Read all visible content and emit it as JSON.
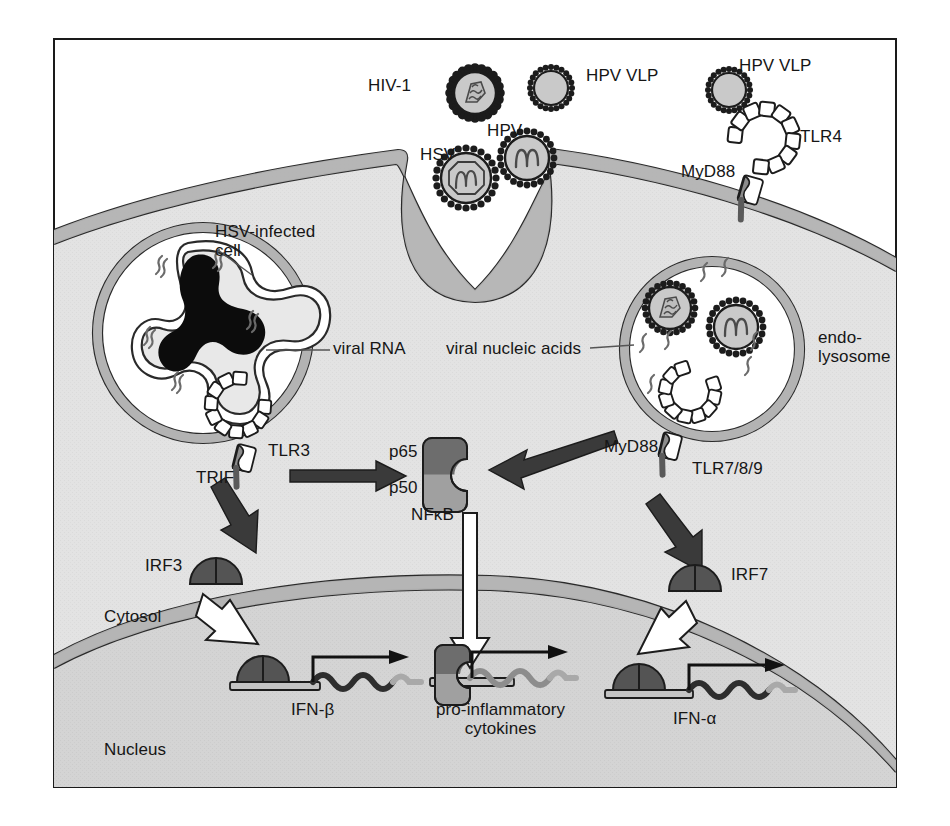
{
  "figure": {
    "frame": {
      "x": 53,
      "y": 38,
      "width": 844,
      "height": 750,
      "border_color": "#1a1a1a"
    },
    "palette": {
      "background": "#ffffff",
      "cytosol_fill": "#e3e3e3",
      "nucleus_fill": "#d4d4d4",
      "membrane_fill": "#b3b3b3",
      "membrane_stroke": "#2a2a2a",
      "capsid_stroke": "#1c1c1c",
      "virion_fill": "#c9c9c9",
      "dark_arrow": "#3a3a3a",
      "white_arrow_fill": "#ffffff",
      "irf_dark": "#545454",
      "nfkb_p65": "#6d6d6d",
      "nfkb_p50": "#a0a0a0",
      "tlr_fill": "#ffffff",
      "adaptor_fill": "#8c8c8c",
      "gene_dark": "#3a3a3a",
      "gene_light": "#a9a9a9",
      "text": "#161616"
    }
  },
  "labels": {
    "hiv1": "HIV-1",
    "hpv_vlp_center": "HPV VLP",
    "hpv_vlp_right": "HPV VLP",
    "hsv": "HSV",
    "hpv": "HPV",
    "tlr4": "TLR4",
    "myd88_top": "MyD88",
    "hsv_infected_cell": "HSV-infected\ncell",
    "viral_rna": "viral RNA",
    "viral_nucleic_acids": "viral nucleic acids",
    "endolysosome": "endo-\nlysosome",
    "tlr3": "TLR3",
    "trif": "TRIF",
    "myd88_right": "MyD88",
    "tlr789": "TLR7/8/9",
    "p65": "p65",
    "p50": "p50",
    "nfkb": "NFκB",
    "irf3": "IRF3",
    "irf7": "IRF7",
    "cytosol": "Cytosol",
    "nucleus": "Nucleus",
    "ifn_beta": "IFN-β",
    "pro_inflammatory_cytokines": "pro-inflammatory\ncytokines",
    "ifn_alpha": "IFN-α"
  },
  "entities": {
    "virions": [
      {
        "name": "HIV-1",
        "type": "enveloped-virion",
        "content": "rna-squiggle",
        "cx": 475,
        "cy": 93,
        "r": 25
      },
      {
        "name": "HPV VLP",
        "type": "empty-capsid",
        "content": "none",
        "cx": 551,
        "cy": 88,
        "r": 21
      },
      {
        "name": "HSV",
        "type": "enveloped-virion",
        "content": "dna-hexagon",
        "cx": 466,
        "cy": 178,
        "r": 30
      },
      {
        "name": "HPV",
        "type": "enveloped-virion",
        "content": "dna-squiggle",
        "cx": 527,
        "cy": 158,
        "r": 27
      },
      {
        "name": "HPV VLP",
        "type": "empty-capsid",
        "content": "none",
        "cx": 729,
        "cy": 90,
        "r": 21
      },
      {
        "name": "endolysosome virion 1",
        "type": "enveloped-virion",
        "content": "rna-squiggle",
        "cx": 670,
        "cy": 308,
        "r": 25
      },
      {
        "name": "endolysosome virion 2",
        "type": "enveloped-virion",
        "content": "dna-squiggle",
        "cx": 736,
        "cy": 327,
        "r": 27
      }
    ],
    "receptors": [
      {
        "name": "TLR4",
        "location": "plasma membrane",
        "adaptor": "MyD88"
      },
      {
        "name": "TLR3",
        "location": "HSV-infected cell endosome",
        "adaptor": "TRIF"
      },
      {
        "name": "TLR7/8/9",
        "location": "endolysosome",
        "adaptor": "MyD88"
      }
    ],
    "transcription_factors": [
      {
        "name": "IRF3",
        "activated_by": "TRIF",
        "target_gene": "IFN-β"
      },
      {
        "name": "NFκB",
        "subunits": [
          "p65",
          "p50"
        ],
        "activated_by": [
          "TRIF",
          "MyD88"
        ],
        "target_gene": "pro-inflammatory cytokines"
      },
      {
        "name": "IRF7",
        "activated_by": "MyD88",
        "target_gene": "IFN-α"
      }
    ],
    "compartments": [
      "Cytosol",
      "Nucleus",
      "endo-lysosome",
      "HSV-infected cell"
    ]
  }
}
